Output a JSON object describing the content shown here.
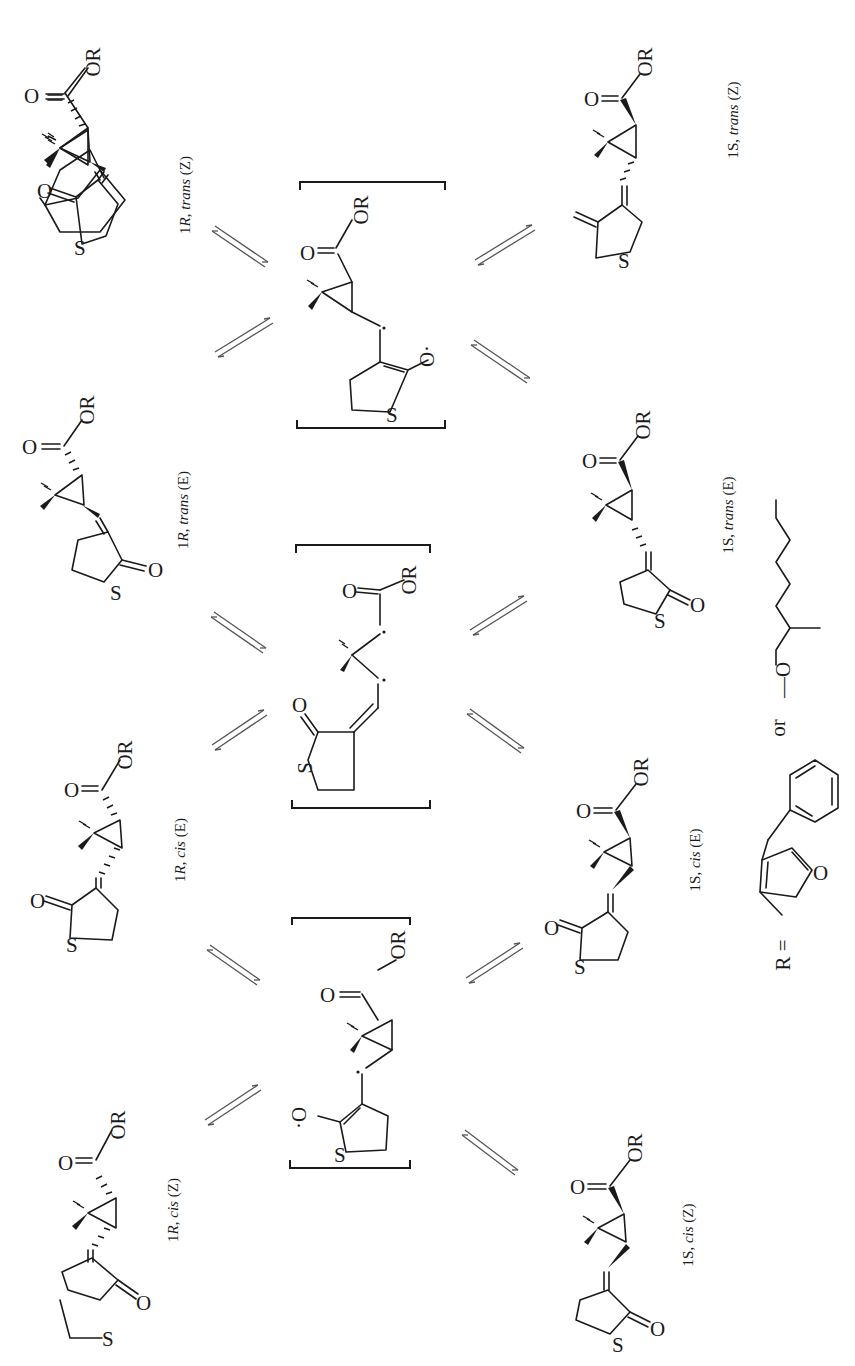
{
  "figure": {
    "orientation": "rotated 90 degrees counter-clockwise",
    "ink_color": "#1a1a1a",
    "background": "#ffffff"
  },
  "atoms": {
    "ester": "OR",
    "carbonyl_o": "O",
    "sulfur": "S",
    "oxy_radical": "O·",
    "oxy_radical_left": "·O",
    "radical_dot": "·"
  },
  "isomers_top_row": [
    {
      "id": "1R-trans-Z",
      "label_prefix": "1",
      "label_config": "R",
      "label_rest": ", ",
      "label_geom": "trans",
      "label_iso": "(Z)"
    },
    {
      "id": "1R-trans-E",
      "label_prefix": "1",
      "label_config": "R",
      "label_rest": ", ",
      "label_geom": "trans",
      "label_iso": "(E)"
    },
    {
      "id": "1R-cis-E",
      "label_prefix": "1",
      "label_config": "R",
      "label_rest": ", ",
      "label_geom": "cis",
      "label_iso": "(E)"
    },
    {
      "id": "1R-cis-Z",
      "label_prefix": "1",
      "label_config": "R",
      "label_rest": ", ",
      "label_geom": "cis",
      "label_iso": "(Z)"
    }
  ],
  "isomers_bottom_row": [
    {
      "id": "1S-trans-Z",
      "label_prefix": "1",
      "label_config": "S",
      "label_rest": ", ",
      "label_geom": "trans",
      "label_iso": "(Z)"
    },
    {
      "id": "1S-trans-E",
      "label_prefix": "1",
      "label_config": "S",
      "label_rest": ", ",
      "label_geom": "trans",
      "label_iso": "(E)"
    },
    {
      "id": "1S-cis-E",
      "label_prefix": "1",
      "label_config": "S",
      "label_rest": ", ",
      "label_geom": "cis",
      "label_iso": "(E)"
    },
    {
      "id": "1S-cis-Z",
      "label_prefix": "1",
      "label_config": "S",
      "label_rest": ", ",
      "label_geom": "cis",
      "label_iso": "(Z)"
    }
  ],
  "intermediates": [
    {
      "id": "diradical-enolate-upper",
      "type": "bracketed radical intermediate"
    },
    {
      "id": "diradical-ring-opened",
      "type": "bracketed ring-opened 1,3-diradical"
    },
    {
      "id": "diradical-enolate-lower",
      "type": "bracketed radical intermediate"
    }
  ],
  "equilibrium_arrows_count": 12,
  "r_group_legend": {
    "prefix": "R =",
    "option1": "(5-benzyl-3-furyl)methyl",
    "connector": "or",
    "option2_prefix": "—O",
    "option2": "2-methylhexyl chain"
  }
}
